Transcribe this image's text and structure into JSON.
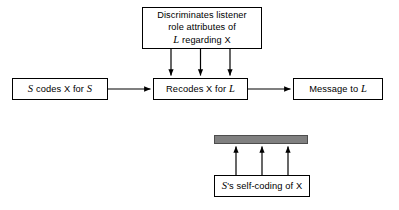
{
  "diagram": {
    "type": "flow-diagram",
    "title": "",
    "background_color": "#ffffff",
    "line_color": "#000000",
    "bar_color": "#808080",
    "nodes": {
      "discriminates": {
        "line1": "Discriminates listener",
        "line2": "role attributes of",
        "line3_italic": "L",
        "line3_rest": " regarding X"
      },
      "codes": {
        "pre_italic": "S",
        "middle": " codes X for ",
        "post_italic": "S"
      },
      "recodes": {
        "text": "Recodes X for ",
        "italic": "L"
      },
      "message": {
        "text": "Message to ",
        "italic": "L"
      },
      "selfcoding": {
        "italic": "S",
        "text": "'s self-coding of X"
      }
    },
    "edges": [
      {
        "from": "codes",
        "to": "recodes",
        "direction": "right"
      },
      {
        "from": "recodes",
        "to": "message",
        "direction": "right"
      },
      {
        "from": "discriminates",
        "to": "recodes",
        "direction": "down",
        "count": 3
      },
      {
        "from": "selfcoding",
        "to": "receiver-bar",
        "direction": "up",
        "count": 3
      }
    ]
  }
}
